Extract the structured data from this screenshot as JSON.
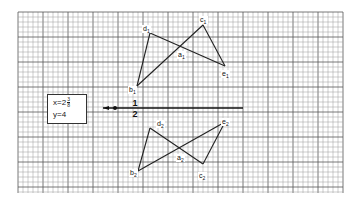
{
  "diagram": {
    "type": "geometry-projection",
    "grid": {
      "x0": 18,
      "y0": 12,
      "x1": 343,
      "y1": 193,
      "minor_step": 5,
      "major_every": 5,
      "minor_color": "#9a9a9a",
      "major_color": "#555555"
    },
    "info_box": {
      "x_label": "x=2",
      "x_frac_num": "3",
      "x_frac_den": "8",
      "y_label": "y=4"
    },
    "axis": {
      "x_start": 103,
      "x_end": 243,
      "y": 108,
      "dot_x": 115,
      "label_top": "1",
      "label_bottom": "2",
      "label_x": 135
    },
    "figures": [
      {
        "name": "view-1",
        "points": {
          "d1": [
            150,
            33
          ],
          "c1": [
            203,
            25
          ],
          "a1": [
            181,
            46
          ],
          "b1": [
            137,
            86
          ],
          "e1": [
            225,
            66
          ]
        },
        "edges": [
          [
            "b1",
            "d1"
          ],
          [
            "d1",
            "e1"
          ],
          [
            "e1",
            "c1"
          ],
          [
            "c1",
            "b1"
          ]
        ],
        "labels": [
          {
            "id": "d1",
            "text": "d",
            "sub": "1",
            "x": 143,
            "y": 31
          },
          {
            "id": "c1",
            "text": "c",
            "sub": "1",
            "x": 200,
            "y": 22
          },
          {
            "id": "a1",
            "text": "a",
            "sub": "1",
            "x": 178,
            "y": 57
          },
          {
            "id": "b1",
            "text": "b",
            "sub": "1",
            "x": 129,
            "y": 92
          },
          {
            "id": "e1",
            "text": "e",
            "sub": "1",
            "x": 222,
            "y": 76
          }
        ]
      },
      {
        "name": "view-2",
        "points": {
          "d2": [
            150,
            128
          ],
          "e2": [
            225,
            122
          ],
          "a2": [
            181,
            148
          ],
          "b2": [
            138,
            171
          ],
          "c2": [
            203,
            164
          ]
        },
        "edges": [
          [
            "b2",
            "d2"
          ],
          [
            "d2",
            "c2"
          ],
          [
            "c2",
            "e2"
          ],
          [
            "e2",
            "b2"
          ]
        ],
        "labels": [
          {
            "id": "d2",
            "text": "d",
            "sub": "2",
            "x": 157,
            "y": 126
          },
          {
            "id": "e2",
            "text": "e",
            "sub": "2",
            "x": 222,
            "y": 124
          },
          {
            "id": "a2",
            "text": "a",
            "sub": "2",
            "x": 177,
            "y": 160
          },
          {
            "id": "b2",
            "text": "b",
            "sub": "2",
            "x": 130,
            "y": 175
          },
          {
            "id": "c2",
            "text": "c",
            "sub": "2",
            "x": 199,
            "y": 178
          }
        ]
      }
    ],
    "line_color": "#222222"
  }
}
